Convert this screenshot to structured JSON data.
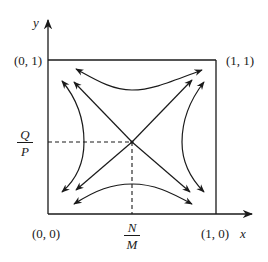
{
  "diagram": {
    "type": "phase-portrait",
    "axes": {
      "x_label": "x",
      "y_label": "y"
    },
    "corner_labels": {
      "top_left": "(0, 1)",
      "top_right": "(1, 1)",
      "bottom_left": "(0, 0)",
      "bottom_right": "(1, 0)"
    },
    "equilibrium": {
      "x_label": {
        "numerator": "N",
        "denominator": "M"
      },
      "y_label": {
        "numerator": "Q",
        "denominator": "P"
      }
    },
    "colors": {
      "line": "#1a1a1a",
      "background": "#ffffff"
    }
  }
}
